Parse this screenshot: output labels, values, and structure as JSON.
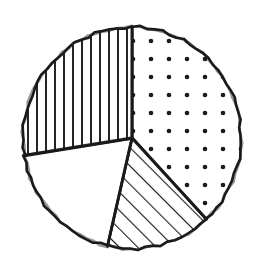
{
  "figure": {
    "title": "",
    "background_color": "#ffffff",
    "ink_color": "#1a1a1a",
    "style": "hand-drawn"
  },
  "geometry": {
    "center_x": 132,
    "center_y": 138,
    "radius_x": 109,
    "radius_y": 111,
    "stroke_width": 2.6
  },
  "chart_data": {
    "type": "pie",
    "title": "",
    "subtitle": "",
    "xlabel": "",
    "ylabel": "",
    "legend": [],
    "legend_position": "none",
    "grid": false,
    "start_angle_deg": 0,
    "direction": "clockwise",
    "labels": [
      "Dotted slice",
      "Diagonal hatch slice",
      "Blank slice",
      "Vertical hatch slice"
    ],
    "values": [
      38.0,
      15.5,
      19.0,
      27.5
    ],
    "units": "percent",
    "slices": [
      {
        "name": "dotted-slice",
        "fill_pattern": "dots",
        "start_deg": 0,
        "end_deg": 137,
        "sweep_deg": 137,
        "value": 38.0,
        "label": ""
      },
      {
        "name": "diagonal-hatch-slice",
        "fill_pattern": "diagonal-lines",
        "start_deg": 137,
        "end_deg": 193,
        "sweep_deg": 56,
        "value": 15.5,
        "label": ""
      },
      {
        "name": "blank-slice",
        "fill_pattern": "none",
        "start_deg": 193,
        "end_deg": 261,
        "sweep_deg": 68,
        "value": 19.0,
        "label": ""
      },
      {
        "name": "vertical-hatch-slice",
        "fill_pattern": "vertical-lines",
        "start_deg": 261,
        "end_deg": 360,
        "sweep_deg": 99,
        "value": 27.5,
        "label": ""
      }
    ]
  },
  "patterns": {
    "dots": {
      "spacing": 18,
      "dot_radius": 2.3,
      "color": "#1a1a1a"
    },
    "diagonal": {
      "spacing": 13,
      "angle_deg": 45,
      "line_width": 2.2,
      "color": "#1a1a1a"
    },
    "vertical": {
      "spacing": 9,
      "line_width": 1.9,
      "color": "#1a1a1a"
    }
  }
}
